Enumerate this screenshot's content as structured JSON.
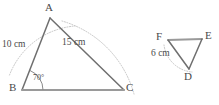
{
  "figure": {
    "colors": {
      "solid_line": "#7c7c7c",
      "dotted_line": "#b9b9b9",
      "text": "#4a4a4a",
      "background": "#ffffff"
    },
    "triangle_abc": {
      "name": "triangle-abc",
      "vertices": [
        {
          "id": "A",
          "label": "A",
          "x": 50,
          "y": 18,
          "label_x": 45,
          "label_y": 3
        },
        {
          "id": "B",
          "label": "B",
          "x": 22,
          "y": 90,
          "label_x": 10,
          "label_y": 83
        },
        {
          "id": "C",
          "label": "C",
          "x": 124,
          "y": 90,
          "label_x": 127,
          "label_y": 83
        }
      ],
      "sides": [
        {
          "id": "AB",
          "from": "B",
          "to": "A",
          "measure": "10 cm"
        },
        {
          "id": "AC",
          "from": "A",
          "to": "C",
          "measure": "15 cm"
        },
        {
          "id": "BC",
          "from": "B",
          "to": "C",
          "measure": ""
        }
      ],
      "measures": [
        {
          "id": "side-ab-measure",
          "text": "10 cm",
          "x": 3,
          "y": 45
        },
        {
          "id": "side-ac-measure",
          "text": "15 cm",
          "x": 62,
          "y": 42
        }
      ],
      "angle": {
        "id": "angle-b",
        "at": "B",
        "text": "70°",
        "label_x": 33,
        "label_y": 77
      },
      "construction_arcs": [
        {
          "id": "arc-from-b-radius-10",
          "center": "B",
          "note": "dotted arc through A"
        },
        {
          "id": "arc-from-a-radius-15",
          "center": "A",
          "note": "dotted arc through C"
        }
      ]
    },
    "triangle_def": {
      "name": "triangle-def",
      "vertices": [
        {
          "id": "F",
          "label": "F",
          "x": 168,
          "y": 40,
          "label_x": 156,
          "label_y": 33
        },
        {
          "id": "E",
          "label": "E",
          "x": 202,
          "y": 39,
          "label_x": 205,
          "label_y": 32
        },
        {
          "id": "D",
          "label": "D",
          "x": 189,
          "y": 69,
          "label_x": 184,
          "label_y": 73
        }
      ],
      "sides": [
        {
          "id": "FE",
          "from": "F",
          "to": "E",
          "measure": ""
        },
        {
          "id": "ED",
          "from": "E",
          "to": "D",
          "measure": ""
        },
        {
          "id": "FD",
          "from": "F",
          "to": "D",
          "measure": "6 cm"
        }
      ],
      "measures": [
        {
          "id": "side-fd-measure",
          "text": "6 cm",
          "x": 152,
          "y": 53
        }
      ],
      "construction_arcs": [
        {
          "id": "arc-from-f-radius-6",
          "center": "F",
          "note": "dotted arc through D"
        }
      ]
    }
  }
}
